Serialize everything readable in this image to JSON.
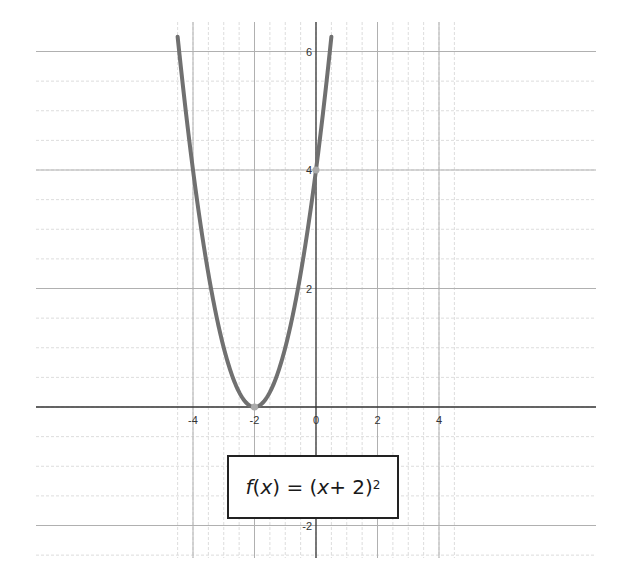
{
  "chart_data": {
    "type": "line",
    "title": "",
    "function_label": {
      "name": "f",
      "variable": "x",
      "expression_base": "(x + 2)",
      "exponent": "2",
      "full_text": "f(x) = (x + 2)^2"
    },
    "xlabel": "",
    "ylabel": "",
    "xlim": [
      -4.5,
      4.5
    ],
    "ylim": [
      -2.6,
      6.5
    ],
    "x_ticks": [
      -4,
      -2,
      0,
      2,
      4
    ],
    "x_tick_labels": [
      "-4",
      "-2",
      "0",
      "2",
      "4"
    ],
    "y_ticks": [
      -2,
      2,
      4,
      6
    ],
    "y_tick_labels": [
      "-2",
      "2",
      "4",
      "6"
    ],
    "grid": true,
    "minor_grid_step": 0.5,
    "legend": null,
    "series": [
      {
        "name": "f(x) = (x + 2)^2",
        "color": "#707070",
        "x": [
          -4.5,
          -4,
          -3.5,
          -3,
          -2.5,
          -2,
          -1.5,
          -1,
          -0.5,
          0,
          0.5
        ],
        "values": [
          6.25,
          4,
          2.25,
          1,
          0.25,
          0,
          0.25,
          1,
          2.25,
          4,
          6.25
        ]
      }
    ],
    "highlighted_points": [
      {
        "label": "vertex",
        "x": -2,
        "y": 0
      },
      {
        "label": "y-intercept",
        "x": 0,
        "y": 4
      }
    ]
  },
  "labels": {
    "fn_name": "f",
    "fn_open": "(",
    "fn_var": "x",
    "fn_close_eq": ") = (",
    "fn_var2": "x",
    "fn_tail": " + 2)",
    "fn_exp": "2"
  },
  "colors": {
    "curve": "#707070",
    "axis": "#333333",
    "major_grid": "#b0b0b0",
    "minor_grid": "#dddddd",
    "point": "#aaaaaa"
  }
}
